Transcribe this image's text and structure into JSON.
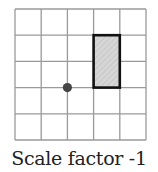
{
  "caption": "Scale factor -1",
  "grid": {
    "cols": 5,
    "rows": 5,
    "origin_x": 15,
    "origin_y": 9,
    "cell": 26.2,
    "line_color": "#9a9a9a"
  },
  "shape": {
    "type": "rectangle",
    "col": 3,
    "row": 1,
    "width_cells": 1,
    "height_cells": 2,
    "fill": "#d4d4d4",
    "stroke": "#111111"
  },
  "center_point": {
    "grid_x": 2,
    "grid_y": 3,
    "color": "#444444"
  }
}
